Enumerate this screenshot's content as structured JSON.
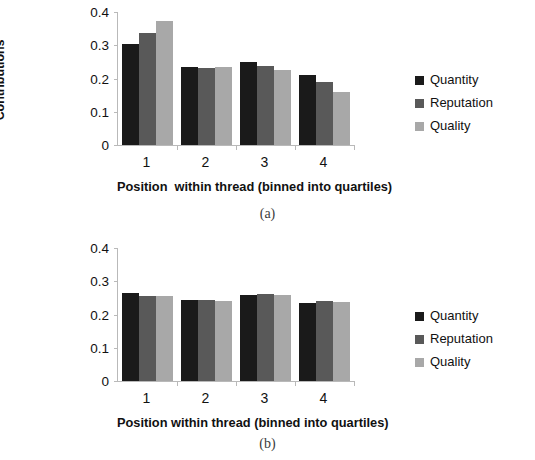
{
  "chart_data": [
    {
      "type": "bar",
      "panel": "a",
      "caption": "(a)",
      "title": "",
      "ylabel": "Proportion of\nSuperposter\nContributions",
      "xlabel": "Position  within thread (binned into quartiles)",
      "categories": [
        "1",
        "2",
        "3",
        "4"
      ],
      "yticks": [
        "0",
        "0.1",
        "0.2",
        "0.3",
        "0.4"
      ],
      "ytick_values": [
        0,
        0.1,
        0.2,
        0.3,
        0.4
      ],
      "ylim": [
        0,
        0.4
      ],
      "grid": false,
      "legend_position": "right",
      "series": [
        {
          "name": "Quantity",
          "color": "#1a1a1a",
          "values": [
            0.303,
            0.235,
            0.25,
            0.21
          ]
        },
        {
          "name": "Reputation",
          "color": "#595959",
          "values": [
            0.338,
            0.233,
            0.238,
            0.19
          ]
        },
        {
          "name": "Quality",
          "color": "#a8a8a8",
          "values": [
            0.372,
            0.236,
            0.227,
            0.16
          ]
        }
      ]
    },
    {
      "type": "bar",
      "panel": "b",
      "caption": "(b)",
      "title": "",
      "ylabel": "Proportion of Non-\nSuperposter\nContributions",
      "xlabel": "Position within thread (binned into quartiles)",
      "categories": [
        "1",
        "2",
        "3",
        "4"
      ],
      "yticks": [
        "0",
        "0.1",
        "0.2",
        "0.3",
        "0.4"
      ],
      "ytick_values": [
        0,
        0.1,
        0.2,
        0.3,
        0.4
      ],
      "ylim": [
        0,
        0.4
      ],
      "grid": false,
      "legend_position": "right",
      "series": [
        {
          "name": "Quantity",
          "color": "#1a1a1a",
          "values": [
            0.266,
            0.245,
            0.26,
            0.234
          ]
        },
        {
          "name": "Reputation",
          "color": "#595959",
          "values": [
            0.256,
            0.243,
            0.262,
            0.24
          ]
        },
        {
          "name": "Quality",
          "color": "#a8a8a8",
          "values": [
            0.257,
            0.24,
            0.26,
            0.239
          ]
        }
      ]
    }
  ]
}
